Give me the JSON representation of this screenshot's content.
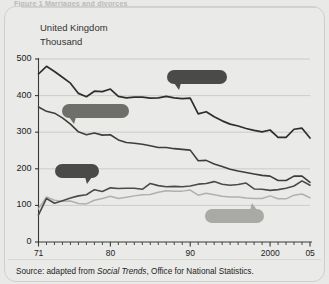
{
  "figure": {
    "caption_top": "Figure 1  Marriages and divorces",
    "region_label": "United Kingdom",
    "units_label": "Thousand",
    "source_prefix": "Source: adapted from ",
    "source_italic": "Social Trends",
    "source_suffix": ", Office for National Statistics."
  },
  "colors": {
    "page_background": "#e9e9e7",
    "card_border": "#cfcfcb",
    "grid": "#c4c4c0",
    "axis": "#3a3a38",
    "all_marriages": "#2e2e2c",
    "first_marriages": "#3d3d3b",
    "divorces": "#4a4a48",
    "remarriages": "#b0b0ac",
    "callout_dark": "#4a4a48",
    "callout_mid": "#6e6e6b",
    "callout_light": "#a9a9a5"
  },
  "callouts": {
    "all_marriages": "All marriages",
    "first_marriages": "First marriages",
    "divorces": "Divorces",
    "remarriages": "Remarriages"
  },
  "chart_data": {
    "type": "line",
    "title": "Figure 1  Marriages and divorces",
    "subtitle": "United Kingdom",
    "xlabel": "",
    "ylabel": "Thousand",
    "ylim": [
      0,
      500
    ],
    "yticks": [
      0,
      100,
      200,
      300,
      400,
      500
    ],
    "ytick_labels": [
      "0",
      "100",
      "200",
      "300",
      "400",
      "500"
    ],
    "xlim": [
      1971,
      2005
    ],
    "xticks": [
      1971,
      1980,
      1990,
      2000,
      2005
    ],
    "xtick_labels": [
      "71",
      "80",
      "90",
      "2000",
      "05"
    ],
    "minor_tick_interval": 1,
    "grid": true,
    "grid_axis": "y",
    "legend": "annotated callouts",
    "x": [
      1971,
      1972,
      1973,
      1974,
      1975,
      1976,
      1977,
      1978,
      1979,
      1980,
      1981,
      1982,
      1983,
      1984,
      1985,
      1986,
      1987,
      1988,
      1989,
      1990,
      1991,
      1992,
      1993,
      1994,
      1995,
      1996,
      1997,
      1998,
      1999,
      2000,
      2001,
      2002,
      2003,
      2004,
      2005
    ],
    "series": [
      {
        "name": "All marriages",
        "values": [
          459,
          480,
          466,
          450,
          434,
          406,
          397,
          412,
          411,
          418,
          398,
          394,
          396,
          396,
          393,
          394,
          398,
          394,
          392,
          393,
          350,
          356,
          342,
          331,
          322,
          317,
          310,
          305,
          301,
          306,
          286,
          286,
          308,
          311,
          284
        ]
      },
      {
        "name": "First marriages",
        "values": [
          369,
          357,
          352,
          339,
          322,
          301,
          293,
          298,
          292,
          293,
          279,
          272,
          270,
          267,
          263,
          258,
          258,
          255,
          253,
          251,
          222,
          223,
          213,
          206,
          199,
          194,
          190,
          186,
          182,
          180,
          168,
          168,
          180,
          180,
          163
        ]
      },
      {
        "name": "Divorces",
        "values": [
          74,
          119,
          106,
          113,
          120,
          126,
          129,
          143,
          138,
          148,
          146,
          147,
          147,
          144,
          160,
          154,
          151,
          152,
          151,
          153,
          158,
          160,
          165,
          158,
          155,
          157,
          161,
          145,
          144,
          141,
          143,
          147,
          153,
          167,
          155
        ]
      },
      {
        "name": "Remarriages",
        "values": [
          91,
          123,
          114,
          111,
          112,
          105,
          104,
          114,
          119,
          125,
          119,
          122,
          126,
          129,
          130,
          136,
          140,
          139,
          139,
          142,
          128,
          133,
          129,
          125,
          123,
          123,
          120,
          119,
          119,
          126,
          118,
          118,
          128,
          131,
          121
        ]
      }
    ]
  }
}
